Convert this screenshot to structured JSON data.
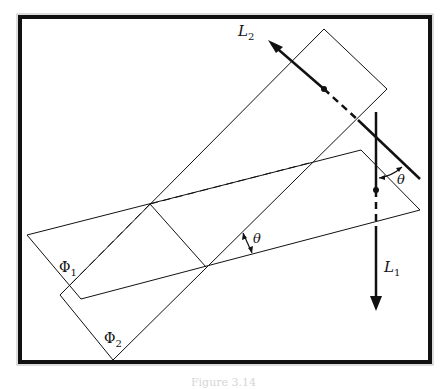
{
  "figure": {
    "labels": {
      "line1": "L",
      "line1_sub": "1",
      "line2": "L",
      "line2_sub": "2",
      "plane1": "Φ",
      "plane1_sub": "1",
      "plane2": "Φ",
      "plane2_sub": "2",
      "angle_planes": "θ",
      "angle_lines": "θ"
    },
    "colors": {
      "stroke": "#111111",
      "frame": "#111111",
      "background": "#ffffff"
    }
  },
  "caption": "Figure 3.14"
}
